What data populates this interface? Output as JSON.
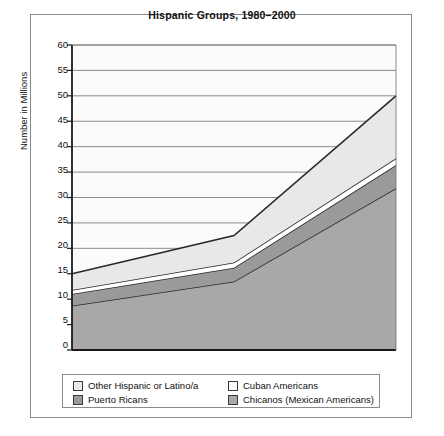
{
  "chart_data": {
    "type": "area",
    "title": "Hispanic Groups, 1980–2000",
    "xlabel": "",
    "ylabel": "Number in Millions",
    "ylim": [
      0,
      60
    ],
    "ytick_step": 5,
    "yticks": [
      "60",
      "55",
      "50",
      "45",
      "40",
      "35",
      "30",
      "25",
      "20",
      "15",
      "10",
      "5",
      "0"
    ],
    "grid": true,
    "legend_position": "below-plot",
    "stacked": true,
    "x": [
      1980,
      1990,
      2000
    ],
    "categories": [
      "1980",
      "1990",
      "2000"
    ],
    "series": [
      {
        "name": "Chicanos (Mexican Americans)",
        "values": [
          8.7,
          13.5,
          31.8
        ],
        "color": "#a8a8a8"
      },
      {
        "name": "Puerto Ricans",
        "values": [
          2.3,
          2.7,
          4.6
        ],
        "color": "#9a9a9a"
      },
      {
        "name": "Cuban Americans",
        "values": [
          0.8,
          1.0,
          1.3
        ],
        "color": "#ffffff"
      },
      {
        "name": "Other Hispanic or Latino/a",
        "values": [
          3.2,
          5.3,
          12.3
        ],
        "color": "#e8e8e8"
      }
    ],
    "cumulative_tops": [
      {
        "name": "Chicanos (Mexican Americans)",
        "values": [
          8.7,
          13.5,
          31.8
        ]
      },
      {
        "name": "Puerto Ricans",
        "values": [
          11.0,
          16.2,
          36.4
        ]
      },
      {
        "name": "Cuban Americans",
        "values": [
          11.8,
          17.2,
          37.7
        ]
      },
      {
        "name": "Other Hispanic or Latino/a",
        "values": [
          15.0,
          22.5,
          50.0
        ]
      }
    ],
    "totals": [
      15.0,
      22.5,
      50.0
    ]
  },
  "legend": {
    "items": [
      {
        "label": "Other Hispanic or Latino/a",
        "color": "#e8e8e8"
      },
      {
        "label": "Cuban Americans",
        "color": "#ffffff"
      },
      {
        "label": "Puerto Ricans",
        "color": "#9a9a9a"
      },
      {
        "label": "Chicanos (Mexican Americans)",
        "color": "#a8a8a8"
      }
    ]
  }
}
